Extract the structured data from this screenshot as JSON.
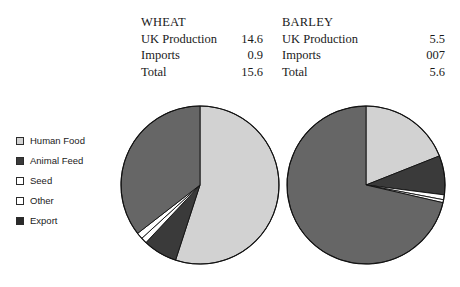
{
  "tables": [
    {
      "name": "wheat",
      "title": "WHEAT",
      "rows": [
        {
          "label": "UK Production",
          "value": "14.6"
        },
        {
          "label": "Imports",
          "value": "0.9"
        },
        {
          "label": "Total",
          "value": "15.6"
        }
      ]
    },
    {
      "name": "barley",
      "title": "BARLEY",
      "rows": [
        {
          "label": "UK Production",
          "value": "5.5"
        },
        {
          "label": "Imports",
          "value": "007"
        },
        {
          "label": "Total",
          "value": "5.6"
        }
      ]
    }
  ],
  "legend": {
    "items": [
      {
        "label": "Human Food",
        "color": "#d2d2d2"
      },
      {
        "label": "Animal Feed",
        "color": "#3a3a3a"
      },
      {
        "label": "Seed",
        "color": "#ffffff"
      },
      {
        "label": "Other",
        "color": "#ffffff"
      },
      {
        "label": "Export",
        "color": "#2a2a2a"
      }
    ]
  },
  "chart_data": [
    {
      "type": "pie",
      "title": "WHEAT",
      "categories": [
        "Human Food",
        "Animal Feed",
        "Seed",
        "Other",
        "Export"
      ],
      "values": [
        55.0,
        7.0,
        1.2,
        1.3,
        35.5
      ],
      "unit": "percent",
      "start_angle": 0,
      "direction": "clockwise",
      "colors": [
        "#d2d2d2",
        "#3a3a3a",
        "#ffffff",
        "#ffffff",
        "#666666"
      ],
      "legend_position": "left"
    },
    {
      "type": "pie",
      "title": "BARLEY",
      "categories": [
        "Human Food",
        "Animal Feed",
        "Seed",
        "Other",
        "Export"
      ],
      "values": [
        19.0,
        8.0,
        1.0,
        0.6,
        71.4
      ],
      "unit": "percent",
      "start_angle": 0,
      "direction": "clockwise",
      "colors": [
        "#d2d2d2",
        "#3a3a3a",
        "#ffffff",
        "#ffffff",
        "#666666"
      ],
      "legend_position": "left"
    }
  ]
}
